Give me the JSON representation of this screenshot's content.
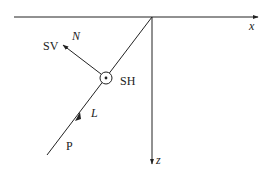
{
  "diagram": {
    "axes": {
      "x_label": "x",
      "z_label": "z"
    },
    "labels": {
      "sv": "SV",
      "n": "N",
      "sh": "SH",
      "l": "L",
      "p": "P"
    },
    "colors": {
      "stroke": "#222222",
      "background": "#ffffff"
    }
  }
}
